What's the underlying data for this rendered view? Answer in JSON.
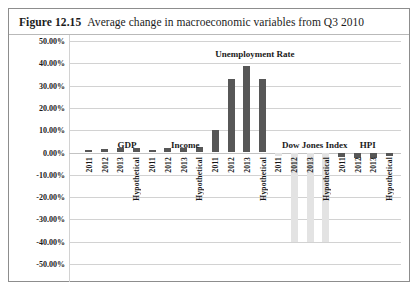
{
  "figure": {
    "label": "Figure 12.15",
    "caption": "Average change in macroeconomic variables from Q3 2010"
  },
  "colors": {
    "bar_dark": "#575757",
    "bar_light": "#e3e3e3",
    "gridline": "#d2d2d2",
    "border": "#8d8d8d",
    "text": "#1a1a1a"
  },
  "chart_data": {
    "type": "bar",
    "title": "Average change in macroeconomic variables from Q3 2010",
    "xlabel": "",
    "ylabel": "",
    "ylim": [
      -50,
      50
    ],
    "grid": true,
    "legend": "none",
    "ytick_labels": [
      "50.00%",
      "40.00%",
      "30.00%",
      "20.00%",
      "10.00%",
      "0.00%",
      "-10.00%",
      "-20.00%",
      "-30.00%",
      "-40.00%",
      "-50.00%"
    ],
    "ytick_values": [
      50,
      40,
      30,
      20,
      10,
      0,
      -10,
      -20,
      -30,
      -40,
      -50
    ],
    "group_labels": [
      "GDP",
      "Income",
      "Unemployment Rate",
      "Dow Jones Index",
      "HPI"
    ],
    "categories": [
      "2011",
      "2012",
      "2013",
      "Hypothetical"
    ],
    "groups": [
      {
        "name": "GDP",
        "label_center_pct": 17.5,
        "bars": [
          {
            "category": "2011",
            "value": 1.0,
            "color": "#575757"
          },
          {
            "category": "2012",
            "value": 1.6,
            "color": "#575757"
          },
          {
            "category": "2013",
            "value": 1.8,
            "color": "#575757"
          },
          {
            "category": "Hypothetical",
            "value": 2.2,
            "color": "#575757"
          }
        ]
      },
      {
        "name": "Income",
        "label_center_pct": 35.0,
        "bars": [
          {
            "category": "2011",
            "value": 1.2,
            "color": "#575757"
          },
          {
            "category": "2012",
            "value": 2.0,
            "color": "#575757"
          },
          {
            "category": "2013",
            "value": 2.0,
            "color": "#575757"
          },
          {
            "category": "Hypothetical",
            "value": 2.4,
            "color": "#575757"
          }
        ]
      },
      {
        "name": "Unemployment Rate",
        "label_center_pct": 56.0,
        "bars": [
          {
            "category": "2011",
            "value": 10.0,
            "color": "#575757"
          },
          {
            "category": "2012",
            "value": 33.0,
            "color": "#575757"
          },
          {
            "category": "2013",
            "value": 39.0,
            "color": "#575757"
          },
          {
            "category": "Hypothetical",
            "value": 33.0,
            "color": "#575757"
          }
        ]
      },
      {
        "name": "Dow Jones Index",
        "label_center_pct": 74.0,
        "bars": [
          {
            "category": "2011",
            "value": -1.5,
            "color": "#e3e3e3"
          },
          {
            "category": "2012",
            "value": -40.0,
            "color": "#e3e3e3"
          },
          {
            "category": "2013",
            "value": -40.0,
            "color": "#e3e3e3"
          },
          {
            "category": "Hypothetical",
            "value": -40.0,
            "color": "#e3e3e3"
          }
        ]
      },
      {
        "name": "HPI",
        "label_center_pct": 90.0,
        "bars": [
          {
            "category": "2011",
            "value": -2.0,
            "color": "#575757"
          },
          {
            "category": "2012",
            "value": -2.4,
            "color": "#575757"
          },
          {
            "category": "2013",
            "value": -2.6,
            "color": "#575757"
          },
          {
            "category": "Hypothetical",
            "value": -1.6,
            "color": "#575757"
          }
        ]
      }
    ]
  }
}
